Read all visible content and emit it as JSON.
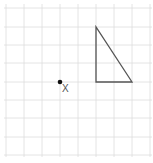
{
  "diagram": {
    "type": "grid-with-shape",
    "grid": {
      "x_lines": [
        6,
        24,
        42,
        60,
        78,
        96,
        114,
        132,
        150
      ],
      "y_lines": [
        8,
        27,
        45,
        63,
        82,
        100,
        118,
        137,
        155
      ],
      "columns": 8,
      "rows": 8,
      "line_color": "#dddddd"
    },
    "triangle": {
      "points": "96,27 96,82 132,82",
      "stroke": "#555555",
      "vertices_grid": [
        [
          5,
          1
        ],
        [
          5,
          4
        ],
        [
          7,
          4
        ]
      ]
    },
    "point": {
      "x": 60,
      "y": 82,
      "label": "X",
      "grid_position": [
        3,
        4
      ],
      "color": "#111111"
    }
  }
}
